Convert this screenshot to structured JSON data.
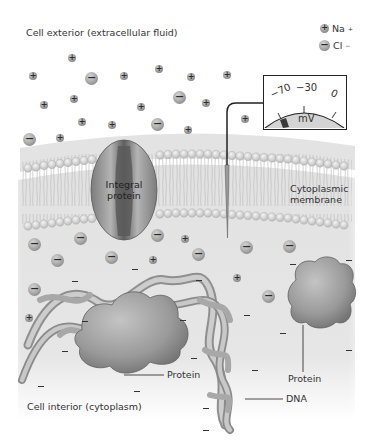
{
  "labels": {
    "cell_exterior": "Cell exterior (extracellular fluid)",
    "cell_interior": "Cell interior (cytoplasm)",
    "integral_protein_line1": "Integral",
    "integral_protein_line2": "protein",
    "cytoplasmic_membrane_line1": "Cytoplasmic",
    "cytoplasmic_membrane_line2": "membrane",
    "protein_left": "Protein",
    "protein_right": "Protein",
    "dna": "DNA"
  },
  "legend": {
    "items": [
      {
        "symbol": "+",
        "label": "Na",
        "superscript": "+",
        "ion": "sodium"
      },
      {
        "symbol": "−",
        "label": "Cl",
        "superscript": "−",
        "ion": "chloride"
      }
    ]
  },
  "voltmeter": {
    "ticks": [
      "−70",
      "−30",
      "0"
    ],
    "unit": "mV",
    "reading": "−70"
  },
  "colors": {
    "membrane_head": "#d6d6d6",
    "cytoplasm": "#e4e4e4",
    "protein": "#9c9c9c",
    "dna": "#b8b8b8",
    "outline": "#222222"
  }
}
